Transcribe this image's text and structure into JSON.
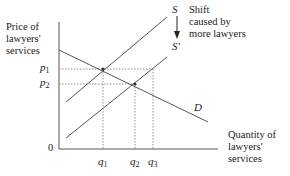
{
  "diagram": {
    "type": "supply-demand",
    "y_axis_label": [
      "Price of",
      "lawyers'",
      "services"
    ],
    "x_axis_label": [
      "Quantity of",
      "lawyers'",
      "services"
    ],
    "origin_label": "0",
    "curves": {
      "supply_original": "S",
      "supply_shifted": "S'",
      "demand": "D"
    },
    "annotation": [
      "Shift",
      "caused by",
      "more lawyers"
    ],
    "price_ticks": [
      {
        "base": "p",
        "sub": "1"
      },
      {
        "base": "p",
        "sub": "2"
      }
    ],
    "quantity_ticks": [
      {
        "base": "q",
        "sub": "1"
      },
      {
        "base": "q",
        "sub": "2"
      },
      {
        "base": "q",
        "sub": "3"
      }
    ],
    "colors": {
      "line": "#555555",
      "dotted": "#666666",
      "text": "#222222"
    }
  }
}
